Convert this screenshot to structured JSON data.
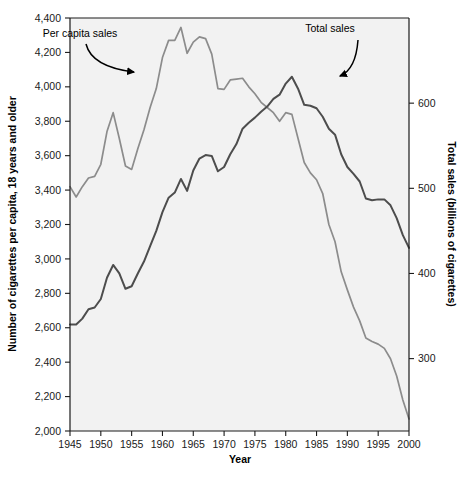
{
  "chart_data": {
    "type": "line",
    "title": "",
    "xlabel": "Year",
    "ylabel": "Number of cigarettes per capita, 18 years and older",
    "ylabel_right": "Total sales (billions of cigarettes)",
    "xlim": [
      1945,
      2000
    ],
    "ylim": [
      2000,
      4400
    ],
    "ylim_right": [
      215,
      700
    ],
    "xticks": [
      1945,
      1950,
      1955,
      1960,
      1965,
      1970,
      1975,
      1980,
      1985,
      1990,
      1995,
      2000
    ],
    "xticklabels": [
      "1945",
      "1950",
      "1955",
      "1960",
      "1965",
      "1970",
      "1975",
      "1980",
      "1985",
      "1990",
      "1995",
      "2000"
    ],
    "yticks": [
      2000,
      2200,
      2400,
      2600,
      2800,
      3000,
      3200,
      3400,
      3600,
      3800,
      4000,
      4200,
      4400
    ],
    "yticklabels": [
      "2,000",
      "2,200",
      "2,400",
      "2,600",
      "2,800",
      "3,000",
      "3,200",
      "3,400",
      "3,600",
      "3,800",
      "4,000",
      "4,200",
      "4,400"
    ],
    "yticks_right": [
      300,
      400,
      500,
      600
    ],
    "yticklabels_right": [
      "300",
      "400",
      "500",
      "600"
    ],
    "grid": false,
    "legend_position": "annotations-inline",
    "plot_background": "#f2f2f2",
    "series": [
      {
        "name": "Per capita sales",
        "axis": "left",
        "color": "#8c8c8c",
        "x": [
          1945,
          1946,
          1947,
          1948,
          1949,
          1950,
          1951,
          1952,
          1953,
          1954,
          1955,
          1956,
          1957,
          1958,
          1959,
          1960,
          1961,
          1962,
          1963,
          1964,
          1965,
          1966,
          1967,
          1968,
          1969,
          1970,
          1971,
          1972,
          1973,
          1974,
          1975,
          1976,
          1977,
          1978,
          1979,
          1980,
          1981,
          1982,
          1983,
          1984,
          1985,
          1986,
          1987,
          1988,
          1989,
          1990,
          1991,
          1992,
          1993,
          1994,
          1995,
          1996,
          1997,
          1998,
          1999,
          2000
        ],
        "values": [
          3420,
          3360,
          3420,
          3470,
          3480,
          3550,
          3740,
          3850,
          3700,
          3540,
          3520,
          3640,
          3750,
          3880,
          3990,
          4170,
          4270,
          4270,
          4345,
          4195,
          4260,
          4290,
          4280,
          4190,
          3990,
          3985,
          4040,
          4045,
          4050,
          4000,
          3960,
          3910,
          3880,
          3850,
          3800,
          3850,
          3840,
          3700,
          3560,
          3500,
          3460,
          3380,
          3200,
          3100,
          2925,
          2820,
          2720,
          2640,
          2540,
          2520,
          2505,
          2480,
          2420,
          2320,
          2180,
          2070
        ]
      },
      {
        "name": "Total sales",
        "axis": "right",
        "color": "#4d4d4d",
        "x": [
          1945,
          1946,
          1947,
          1948,
          1949,
          1950,
          1951,
          1952,
          1953,
          1954,
          1955,
          1956,
          1957,
          1958,
          1959,
          1960,
          1961,
          1962,
          1963,
          1964,
          1965,
          1966,
          1967,
          1968,
          1969,
          1970,
          1971,
          1972,
          1973,
          1974,
          1975,
          1976,
          1977,
          1978,
          1979,
          1980,
          1981,
          1982,
          1983,
          1984,
          1985,
          1986,
          1987,
          1988,
          1989,
          1990,
          1991,
          1992,
          1993,
          1994,
          1995,
          1996,
          1997,
          1998,
          1999,
          2000
        ],
        "values": [
          340,
          340,
          347,
          358,
          360,
          370,
          395,
          410,
          400,
          382,
          385,
          400,
          414,
          432,
          450,
          472,
          489,
          495,
          511,
          497,
          521,
          535,
          539,
          538,
          520,
          525,
          540,
          552,
          570,
          577,
          583,
          590,
          596,
          605,
          610,
          623,
          631,
          617,
          598,
          597,
          594,
          584,
          570,
          563,
          540,
          525,
          517,
          508,
          488,
          486,
          487,
          487,
          480,
          465,
          445,
          430
        ]
      }
    ],
    "annotations": [
      {
        "text": "Per capita sales",
        "label_x": 80,
        "label_y": 37,
        "arrow_from_x": 86,
        "arrow_from_y": 44,
        "arrow_to_x": 134,
        "arrow_to_y": 72
      },
      {
        "text": "Total sales",
        "label_x": 330,
        "label_y": 32,
        "arrow_from_x": 358,
        "arrow_from_y": 40,
        "arrow_to_x": 340,
        "arrow_to_y": 76
      }
    ]
  }
}
